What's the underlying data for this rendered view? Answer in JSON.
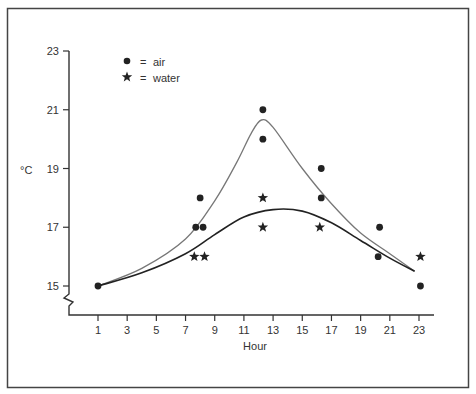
{
  "chart_data": {
    "type": "scatter",
    "title": "",
    "xlabel": "Hour",
    "ylabel": "°C",
    "xlim": [
      1,
      23
    ],
    "ylim": [
      15,
      23
    ],
    "y_axis_break": true,
    "x_ticks": [
      1,
      3,
      5,
      7,
      9,
      11,
      13,
      15,
      17,
      19,
      21,
      23
    ],
    "y_ticks": [
      15,
      17,
      19,
      21,
      23
    ],
    "grid": false,
    "legend": {
      "placement": "top-left",
      "entries": [
        {
          "marker": "dot",
          "symbol_label": "=",
          "label": "air"
        },
        {
          "marker": "star",
          "symbol_label": "=",
          "label": "water"
        }
      ]
    },
    "series": [
      {
        "name": "air",
        "marker": "dot",
        "color": "#222222",
        "points": [
          {
            "x": 1,
            "y": 15
          },
          {
            "x": 7.7,
            "y": 17
          },
          {
            "x": 8.2,
            "y": 17
          },
          {
            "x": 8.0,
            "y": 18
          },
          {
            "x": 12.3,
            "y": 21
          },
          {
            "x": 12.3,
            "y": 20
          },
          {
            "x": 16.3,
            "y": 19
          },
          {
            "x": 16.3,
            "y": 18
          },
          {
            "x": 20.3,
            "y": 17
          },
          {
            "x": 20.2,
            "y": 16
          },
          {
            "x": 23.1,
            "y": 15
          }
        ],
        "trend_curve": {
          "color": "#777777",
          "points": [
            [
              1,
              15
            ],
            [
              4,
              15.6
            ],
            [
              7,
              16.6
            ],
            [
              9,
              17.9
            ],
            [
              10.5,
              19.2
            ],
            [
              11.5,
              20.2
            ],
            [
              12.2,
              20.65
            ],
            [
              13,
              20.4
            ],
            [
              15,
              19.0
            ],
            [
              17,
              17.8
            ],
            [
              19,
              16.8
            ],
            [
              21,
              16.1
            ],
            [
              22.7,
              15.5
            ]
          ]
        }
      },
      {
        "name": "water",
        "marker": "star",
        "color": "#222222",
        "points": [
          {
            "x": 7.6,
            "y": 16
          },
          {
            "x": 8.3,
            "y": 16
          },
          {
            "x": 12.3,
            "y": 18
          },
          {
            "x": 12.3,
            "y": 17
          },
          {
            "x": 16.2,
            "y": 17
          },
          {
            "x": 23.1,
            "y": 16
          }
        ],
        "trend_curve": {
          "color": "#222222",
          "points": [
            [
              1,
              15
            ],
            [
              4,
              15.45
            ],
            [
              7,
              16.1
            ],
            [
              9,
              16.75
            ],
            [
              11,
              17.35
            ],
            [
              13,
              17.6
            ],
            [
              15,
              17.55
            ],
            [
              17,
              17.15
            ],
            [
              19,
              16.55
            ],
            [
              21,
              15.95
            ],
            [
              22.7,
              15.5
            ]
          ]
        }
      }
    ]
  }
}
